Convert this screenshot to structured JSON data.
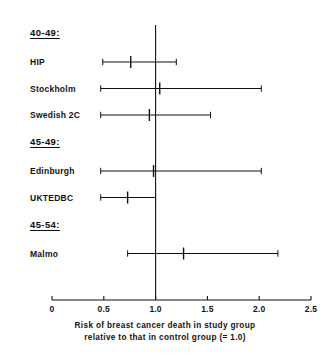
{
  "chart_data": {
    "type": "scatter",
    "subtype": "forest-plot",
    "title": "",
    "xlabel_lines": [
      "Risk of breast cancer death in study group",
      "relative to that in control group (= 1.0)"
    ],
    "ylabel": "",
    "xlim": [
      0,
      2.5
    ],
    "xticks": [
      0,
      0.5,
      1.0,
      1.5,
      2.0,
      2.5
    ],
    "xtick_labels": [
      "0",
      "0.5",
      "1.0",
      "1.5",
      "2.0",
      "2.5"
    ],
    "grid": false,
    "legend": null,
    "reference_line": 1.0,
    "axis_color": "#111111",
    "marker_color": "#111111",
    "groups": [
      {
        "label": "40-49:",
        "studies": [
          {
            "name": "HIP",
            "estimate": 0.76,
            "ci_low": 0.49,
            "ci_high": 1.2
          },
          {
            "name": "Stockholm",
            "estimate": 1.04,
            "ci_low": 0.47,
            "ci_high": 2.02
          },
          {
            "name": "Swedish 2C",
            "estimate": 0.94,
            "ci_low": 0.47,
            "ci_high": 1.53
          }
        ]
      },
      {
        "label": "45-49:",
        "studies": [
          {
            "name": "Edinburgh",
            "estimate": 0.98,
            "ci_low": 0.47,
            "ci_high": 2.02
          },
          {
            "name": "UKTEDBC",
            "estimate": 0.73,
            "ci_low": 0.47,
            "ci_high": 1.0
          }
        ]
      },
      {
        "label": "45-54:",
        "studies": [
          {
            "name": "Malmo",
            "estimate": 1.27,
            "ci_low": 0.73,
            "ci_high": 2.18
          }
        ]
      }
    ]
  }
}
